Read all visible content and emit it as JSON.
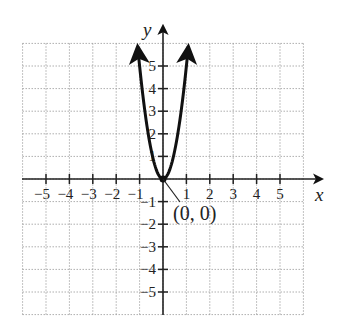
{
  "chart_data": {
    "type": "line",
    "title": "",
    "function": "y = 5x^2",
    "xlabel": "x",
    "ylabel": "y",
    "xlim": [
      -6,
      6
    ],
    "ylim": [
      -6,
      6
    ],
    "grid": true,
    "x_ticks": [
      -5,
      -4,
      -3,
      -2,
      -1,
      1,
      2,
      3,
      4,
      5
    ],
    "y_ticks": [
      5,
      4,
      3,
      2,
      1,
      -1,
      -2,
      -3,
      -4,
      -5
    ],
    "x_tick_labels": [
      "−5",
      "−4",
      "−3",
      "−2",
      "−1",
      "1",
      "2",
      "3",
      "4",
      "5"
    ],
    "y_tick_labels": [
      "5",
      "4",
      "3",
      "2",
      "1",
      "−1",
      "−2",
      "−3",
      "−4",
      "−5"
    ],
    "series": [
      {
        "name": "parabola",
        "x": [
          -1.08,
          -1,
          -0.8,
          -0.6,
          -0.4,
          -0.2,
          0,
          0.2,
          0.4,
          0.6,
          0.8,
          1,
          1.08
        ],
        "y": [
          5.83,
          5,
          3.2,
          1.8,
          0.8,
          0.2,
          0,
          0.2,
          0.8,
          1.8,
          3.2,
          5,
          5.83
        ]
      }
    ],
    "annotations": [
      {
        "text": "(0, 0)",
        "x": 0,
        "y": 0,
        "type": "vertex"
      }
    ]
  },
  "labels": {
    "x_axis": "x",
    "y_axis": "y",
    "vertex": "(0, 0)"
  },
  "colors": {
    "axis": "#222222",
    "grid": "#9a9a9a",
    "curve": "#111111"
  }
}
